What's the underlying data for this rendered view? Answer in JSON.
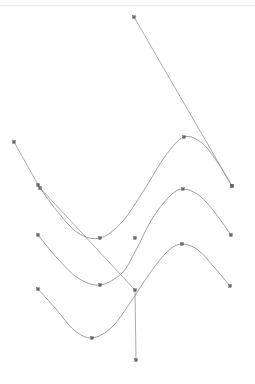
{
  "canvas": {
    "width": 255,
    "height": 384,
    "background": "#ffffff"
  },
  "top_rule": {
    "label": "top-divider",
    "y": 5.5,
    "x_start": 0,
    "x_end": 255,
    "color": "#ededed",
    "width": 1.4
  },
  "chart_data": {
    "type": "line",
    "title": "",
    "subtitle": "",
    "xlabel": "",
    "ylabel": "",
    "xlim": [
      0,
      255
    ],
    "ylim": [
      384,
      0
    ],
    "grid": false,
    "legend": null,
    "axes_visible": false,
    "tick_labels_x": [],
    "tick_labels_y": [],
    "marker": "square",
    "marker_size": 2.6,
    "line_width": 0.7,
    "series": [
      {
        "name": "curve-upper",
        "color": "#777777",
        "style": "smooth",
        "points": [
          {
            "x": 38,
            "y": 185
          },
          {
            "x": 57,
            "y": 211
          },
          {
            "x": 78,
            "y": 233
          },
          {
            "x": 100,
            "y": 238
          },
          {
            "x": 122,
            "y": 222
          },
          {
            "x": 144,
            "y": 190
          },
          {
            "x": 166,
            "y": 155
          },
          {
            "x": 184,
            "y": 137
          },
          {
            "x": 202,
            "y": 143
          },
          {
            "x": 218,
            "y": 163
          },
          {
            "x": 232,
            "y": 186
          }
        ]
      },
      {
        "name": "curve-middle",
        "color": "#777777",
        "style": "smooth",
        "points": [
          {
            "x": 38,
            "y": 235
          },
          {
            "x": 57,
            "y": 258
          },
          {
            "x": 78,
            "y": 278
          },
          {
            "x": 100,
            "y": 285
          },
          {
            "x": 122,
            "y": 273
          },
          {
            "x": 136,
            "y": 250
          },
          {
            "x": 152,
            "y": 219
          },
          {
            "x": 170,
            "y": 196
          },
          {
            "x": 183,
            "y": 189
          },
          {
            "x": 200,
            "y": 196
          },
          {
            "x": 216,
            "y": 214
          },
          {
            "x": 231,
            "y": 235
          }
        ]
      },
      {
        "name": "curve-lower",
        "color": "#777777",
        "style": "smooth",
        "points": [
          {
            "x": 38,
            "y": 289
          },
          {
            "x": 56,
            "y": 309
          },
          {
            "x": 74,
            "y": 330
          },
          {
            "x": 92,
            "y": 338
          },
          {
            "x": 112,
            "y": 327
          },
          {
            "x": 130,
            "y": 303
          },
          {
            "x": 150,
            "y": 273
          },
          {
            "x": 168,
            "y": 251
          },
          {
            "x": 182,
            "y": 244
          },
          {
            "x": 198,
            "y": 250
          },
          {
            "x": 214,
            "y": 267
          },
          {
            "x": 230,
            "y": 286
          }
        ]
      },
      {
        "name": "line-descending-right",
        "color": "#888888",
        "style": "straight",
        "points": [
          {
            "x": 134,
            "y": 17
          },
          {
            "x": 232,
            "y": 186
          }
        ]
      },
      {
        "name": "line-descending-left",
        "color": "#888888",
        "style": "straight",
        "points": [
          {
            "x": 14,
            "y": 142
          },
          {
            "x": 40,
            "y": 188
          },
          {
            "x": 135,
            "y": 290
          },
          {
            "x": 136,
            "y": 360
          }
        ]
      }
    ],
    "markers": [
      {
        "series": "curve-upper",
        "x": 38,
        "y": 185,
        "name": "marker-upper-start"
      },
      {
        "series": "curve-upper",
        "x": 100,
        "y": 238,
        "name": "marker-upper-trough"
      },
      {
        "series": "curve-upper",
        "x": 184,
        "y": 137,
        "name": "marker-upper-peak"
      },
      {
        "series": "curve-upper",
        "x": 232,
        "y": 186,
        "name": "marker-upper-end"
      },
      {
        "series": "curve-middle",
        "x": 38,
        "y": 235,
        "name": "marker-middle-start"
      },
      {
        "series": "curve-middle",
        "x": 100,
        "y": 285,
        "name": "marker-middle-trough"
      },
      {
        "series": "curve-middle",
        "x": 135,
        "y": 238,
        "name": "marker-middle-mid"
      },
      {
        "series": "curve-middle",
        "x": 183,
        "y": 189,
        "name": "marker-middle-peak"
      },
      {
        "series": "curve-middle",
        "x": 231,
        "y": 235,
        "name": "marker-middle-end"
      },
      {
        "series": "curve-lower",
        "x": 38,
        "y": 289,
        "name": "marker-lower-start"
      },
      {
        "series": "curve-lower",
        "x": 92,
        "y": 338,
        "name": "marker-lower-trough"
      },
      {
        "series": "curve-lower",
        "x": 135,
        "y": 290,
        "name": "marker-lower-mid"
      },
      {
        "series": "curve-lower",
        "x": 182,
        "y": 244,
        "name": "marker-lower-peak"
      },
      {
        "series": "curve-lower",
        "x": 230,
        "y": 286,
        "name": "marker-lower-end"
      },
      {
        "series": "line-descending-right",
        "x": 134,
        "y": 17,
        "name": "marker-line-r-start"
      },
      {
        "series": "line-descending-right",
        "x": 232,
        "y": 186,
        "name": "marker-line-r-end"
      },
      {
        "series": "line-descending-left",
        "x": 14,
        "y": 142,
        "name": "marker-line-l-start"
      },
      {
        "series": "line-descending-left",
        "x": 40,
        "y": 188,
        "name": "marker-line-l-mid"
      },
      {
        "series": "line-descending-left",
        "x": 136,
        "y": 360,
        "name": "marker-line-l-end"
      }
    ]
  }
}
